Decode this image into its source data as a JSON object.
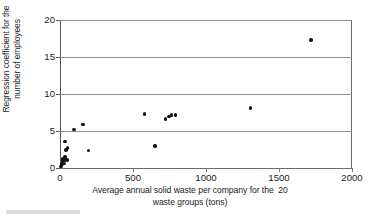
{
  "chart_data": {
    "type": "scatter",
    "title": "",
    "xlabel_line1": "Average annual solid waste per company for the  20",
    "xlabel_line2": "waste groups (tons)",
    "ylabel_line1": "Regression coefficient for the",
    "ylabel_line2": "number of employees",
    "xlim": [
      0,
      2000
    ],
    "ylim": [
      0,
      20
    ],
    "xticks": [
      0,
      500,
      1000,
      1500,
      2000
    ],
    "yticks": [
      0,
      5,
      10,
      15,
      20
    ],
    "xtick_labels": [
      "0",
      "500",
      "1000",
      "1500",
      "2000"
    ],
    "ytick_labels": [
      "0",
      "5",
      "10",
      "15",
      "20"
    ],
    "grid": "horizontal",
    "legend": "none",
    "marker_color": "#111111",
    "gridline_color": "#8d8d8d",
    "axis_color": "#585858",
    "background": "#ffffff",
    "series": [
      {
        "name": "waste groups",
        "points": [
          {
            "x": 5,
            "y": 0.2
          },
          {
            "x": 9,
            "y": 0.45
          },
          {
            "x": 13,
            "y": 0.55
          },
          {
            "x": 16,
            "y": 0.95
          },
          {
            "x": 21,
            "y": 1.25
          },
          {
            "x": 26,
            "y": 1.0
          },
          {
            "x": 31,
            "y": 0.6
          },
          {
            "x": 36,
            "y": 1.5
          },
          {
            "x": 46,
            "y": 1.1
          },
          {
            "x": 41,
            "y": 2.4
          },
          {
            "x": 52,
            "y": 2.7
          },
          {
            "x": 36,
            "y": 3.6
          },
          {
            "x": 96,
            "y": 5.2
          },
          {
            "x": 156,
            "y": 5.9
          },
          {
            "x": 196,
            "y": 2.35
          },
          {
            "x": 580,
            "y": 7.3
          },
          {
            "x": 650,
            "y": 3.0
          },
          {
            "x": 722,
            "y": 6.6
          },
          {
            "x": 748,
            "y": 6.95
          },
          {
            "x": 764,
            "y": 7.2
          },
          {
            "x": 790,
            "y": 7.2
          },
          {
            "x": 1305,
            "y": 8.1
          },
          {
            "x": 1720,
            "y": 17.3
          }
        ]
      }
    ]
  }
}
